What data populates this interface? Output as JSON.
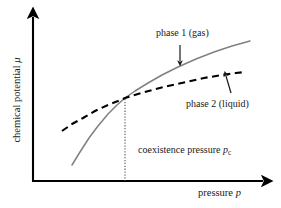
{
  "figure": {
    "background": "#ffffff",
    "axis_color": "#000000",
    "gas_curve_color": "#808080",
    "liquid_curve_color": "#000000",
    "tie_line_color": "#555555"
  },
  "axes": {
    "y_label_text": "chemical potential ",
    "y_label_symbol": "μ",
    "x_label_text": "pressure ",
    "x_label_symbol": "p"
  },
  "annotations": {
    "phase1": "phase 1 (gas)",
    "phase2": "phase 2 (liquid)",
    "coexistence_text": "coexistence pressure ",
    "coexistence_symbol": "p",
    "coexistence_subscript": "c"
  },
  "chart_data": {
    "type": "line",
    "title": "",
    "xlabel": "pressure p",
    "ylabel": "chemical potential μ",
    "grid": false,
    "legend": "annotated inline",
    "axis_origin_px": [
      33,
      181
    ],
    "axis_x_end_px": [
      268,
      181
    ],
    "axis_y_top_px": [
      33,
      13
    ],
    "crossing_point_px": [
      125,
      98
    ],
    "coexistence_dropline": {
      "x_px": 125,
      "y_top_px": 99,
      "y_bottom_px": 181,
      "style": "dotted"
    },
    "series": [
      {
        "name": "phase 1 (gas)",
        "style": "solid",
        "color": "#808080",
        "points_px": [
          [
            72,
            165
          ],
          [
            80,
            152
          ],
          [
            89,
            138
          ],
          [
            98,
            126
          ],
          [
            108,
            114
          ],
          [
            117,
            105
          ],
          [
            125,
            98
          ],
          [
            135,
            91
          ],
          [
            148,
            83
          ],
          [
            162,
            75
          ],
          [
            178,
            67
          ],
          [
            196,
            59
          ],
          [
            214,
            52
          ],
          [
            232,
            46
          ],
          [
            250,
            41
          ]
        ]
      },
      {
        "name": "phase 2 (liquid)",
        "style": "dashed",
        "color": "#000000",
        "points_px": [
          [
            62,
            131
          ],
          [
            72,
            124
          ],
          [
            83,
            118
          ],
          [
            95,
            111
          ],
          [
            108,
            105
          ],
          [
            118,
            101
          ],
          [
            125,
            98
          ],
          [
            138,
            94
          ],
          [
            152,
            90
          ],
          [
            168,
            86
          ],
          [
            186,
            82
          ],
          [
            204,
            78
          ],
          [
            222,
            75
          ],
          [
            236,
            73
          ],
          [
            245,
            72
          ]
        ]
      }
    ],
    "annotation_arrows": [
      {
        "label": "phase 1 (gas)",
        "from_px": [
          180,
          45
        ],
        "to_px": [
          180,
          61
        ],
        "direction": "down"
      },
      {
        "label": "phase 2 (liquid)",
        "from_px": [
          231,
          93
        ],
        "to_px": [
          226,
          76
        ],
        "direction": "up-left"
      }
    ]
  }
}
